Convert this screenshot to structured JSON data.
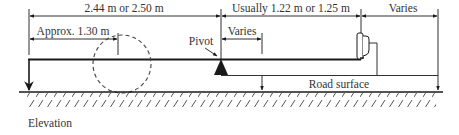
{
  "diagram": {
    "type": "elevation-diagram",
    "caption": "Elevation",
    "labels": {
      "overall_left_span": "2.44 m or 2.50 m",
      "approx_left": "Approx. 1.30 m",
      "pivot": "Pivot",
      "varies_near_pivot": "Varies",
      "usually_span": "Usually 1.22 m or 1.25 m",
      "varies_right": "Varies",
      "road_surface": "Road surface"
    },
    "elements": [
      {
        "name": "beam",
        "description": "horizontal arm"
      },
      {
        "name": "pivot",
        "shape": "filled triangle"
      },
      {
        "name": "counterweight",
        "shape": "rounded block at arm end"
      },
      {
        "name": "swing-path",
        "shape": "dashed circle"
      },
      {
        "name": "road-surface",
        "shape": "hatched ground line"
      }
    ],
    "colors": {
      "line": "#1a1a1a",
      "text": "#333333",
      "dashed": "#444444"
    }
  }
}
